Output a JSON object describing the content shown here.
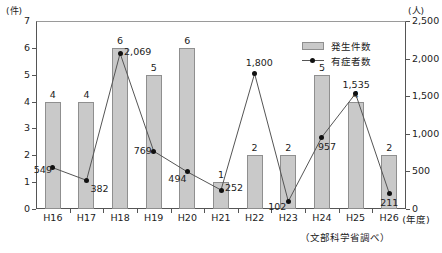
{
  "chart_data": {
    "type": "bar",
    "title": "",
    "xlabel": "(年度)",
    "categories": [
      "H16",
      "H17",
      "H18",
      "H19",
      "H20",
      "H21",
      "H22",
      "H23",
      "H24",
      "H25",
      "H26"
    ],
    "series": [
      {
        "name": "発生件数",
        "axis": "left",
        "unit": "(件)",
        "type": "bar",
        "values": [
          4,
          4,
          6,
          5,
          6,
          1,
          2,
          2,
          5,
          4,
          2
        ]
      },
      {
        "name": "有症者数",
        "axis": "right",
        "unit": "(人)",
        "type": "line",
        "values": [
          549,
          382,
          2069,
          769,
          494,
          252,
          1800,
          102,
          957,
          1535,
          211
        ],
        "value_labels": [
          "549",
          "382",
          "2,069",
          "769",
          "494",
          "252",
          "1,800",
          "102",
          "957",
          "1,535",
          "211"
        ]
      }
    ],
    "ylim_left": [
      0,
      7
    ],
    "yticks_left": [
      "0",
      "1",
      "2",
      "3",
      "4",
      "5",
      "6",
      "7"
    ],
    "ylim_right": [
      0,
      2500
    ],
    "yticks_right": [
      "0",
      "500",
      "1,000",
      "1,500",
      "2,000",
      "2,500"
    ],
    "ylabel_left": "(件)",
    "ylabel_right": "(人)",
    "grid": false,
    "legend_position": "top-right",
    "legend": [
      "発生件数",
      "有症者数"
    ],
    "source_note": "（文部科学省調べ）"
  }
}
